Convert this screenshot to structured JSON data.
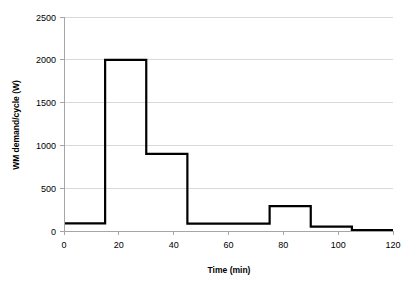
{
  "chart_data": {
    "type": "line",
    "title": "",
    "subtitle": "",
    "xlabel": "Time (min)",
    "ylabel": "WM demand/cycle (W)",
    "xlim": [
      0,
      120
    ],
    "ylim": [
      0,
      2500
    ],
    "xticks": [
      0,
      20,
      40,
      60,
      80,
      100,
      120
    ],
    "yticks": [
      0,
      500,
      1000,
      1500,
      2000,
      2500
    ],
    "xtick_labels": [
      "0",
      "20",
      "40",
      "60",
      "80",
      "100",
      "120"
    ],
    "ytick_labels": [
      "0",
      "500",
      "1000",
      "1500",
      "2000",
      "2500"
    ],
    "grid": "horizontal",
    "legend": "none",
    "line_color": "#000000",
    "grid_color": "#d9d9d9",
    "axis_color": "#a6a6a6",
    "step_style": "post",
    "series": [
      {
        "name": "WM demand/cycle",
        "steps": [
          {
            "start": 0,
            "end": 15,
            "value": 90
          },
          {
            "start": 15,
            "end": 30,
            "value": 2000
          },
          {
            "start": 30,
            "end": 45,
            "value": 900
          },
          {
            "start": 45,
            "end": 75,
            "value": 85
          },
          {
            "start": 75,
            "end": 90,
            "value": 290
          },
          {
            "start": 90,
            "end": 105,
            "value": 50
          },
          {
            "start": 105,
            "end": 120,
            "value": 10
          }
        ],
        "x": [
          0,
          15,
          15,
          30,
          30,
          45,
          45,
          75,
          75,
          90,
          90,
          105,
          105,
          120
        ],
        "y": [
          90,
          90,
          2000,
          2000,
          900,
          900,
          85,
          85,
          290,
          290,
          50,
          50,
          10,
          10
        ]
      }
    ]
  }
}
